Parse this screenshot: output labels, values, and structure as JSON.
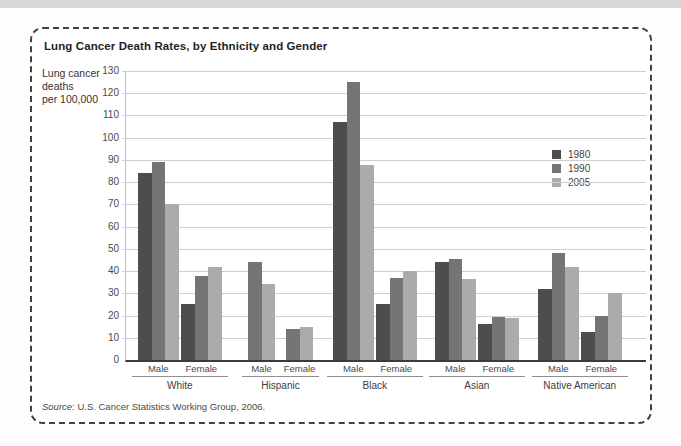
{
  "figure": {
    "title": "Lung Cancer Death Rates, by Ethnicity and Gender",
    "y_axis_unit_lines": [
      "Lung cancer",
      "deaths",
      "per 100,000"
    ],
    "source_word": "Source",
    "source_rest": ": U.S. Cancer Statistics Working Group, 2006."
  },
  "chart_data": {
    "type": "bar",
    "title": "Lung Cancer Death Rates, by Ethnicity and Gender",
    "ylabel": "Lung cancer deaths per 100,000",
    "xlabel": "",
    "ylim": [
      0,
      130
    ],
    "yticks": [
      0,
      10,
      20,
      30,
      40,
      50,
      60,
      70,
      80,
      90,
      100,
      110,
      120,
      130
    ],
    "grid": true,
    "legend_position": "upper-right",
    "series_names": [
      "1980",
      "1990",
      "2005"
    ],
    "series_colors": [
      "#4d4d4f",
      "#757578",
      "#ababad"
    ],
    "groups": [
      {
        "label": "White",
        "subgroups": [
          {
            "label": "Male",
            "values": [
              84,
              89,
              70
            ]
          },
          {
            "label": "Female",
            "values": [
              25,
              38,
              42
            ]
          }
        ]
      },
      {
        "label": "Hispanic",
        "subgroups": [
          {
            "label": "Male",
            "values": [
              null,
              44,
              34
            ]
          },
          {
            "label": "Female",
            "values": [
              null,
              14,
              15
            ]
          }
        ]
      },
      {
        "label": "Black",
        "subgroups": [
          {
            "label": "Male",
            "values": [
              107,
              125,
              87.5
            ]
          },
          {
            "label": "Female",
            "values": [
              25,
              37,
              40
            ]
          }
        ]
      },
      {
        "label": "Asian",
        "subgroups": [
          {
            "label": "Male",
            "values": [
              44,
              45.5,
              36.5
            ]
          },
          {
            "label": "Female",
            "values": [
              16,
              19.5,
              19
            ]
          }
        ]
      },
      {
        "label": "Native American",
        "subgroups": [
          {
            "label": "Male",
            "values": [
              32,
              48,
              42
            ]
          },
          {
            "label": "Female",
            "values": [
              12.5,
              20,
              30
            ]
          }
        ]
      }
    ]
  }
}
